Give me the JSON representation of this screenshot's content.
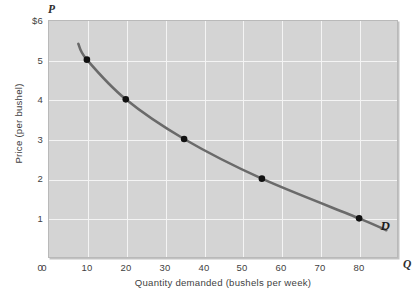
{
  "chart_data": {
    "type": "line",
    "title": "",
    "subtitle": "",
    "xlabel": "Quantity demanded (bushels per week)",
    "ylabel": "Price (per bushel)",
    "x_axis_symbol": "Q",
    "y_axis_symbol": "P",
    "xlim": [
      0,
      90
    ],
    "ylim": [
      0,
      6
    ],
    "grid": true,
    "legend": "none",
    "x_ticks": [
      "0",
      "10",
      "20",
      "30",
      "40",
      "50",
      "60",
      "70",
      "80"
    ],
    "x_tick_values": [
      0,
      10,
      20,
      30,
      40,
      50,
      60,
      70,
      80
    ],
    "y_ticks": [
      "0",
      "1",
      "2",
      "3",
      "4",
      "5",
      "$6"
    ],
    "y_tick_values": [
      0,
      1,
      2,
      3,
      4,
      5,
      6
    ],
    "series": [
      {
        "name": "D",
        "label": "D",
        "color": "#6a6a6a",
        "marker": "filled-circle",
        "marker_color": "#111111",
        "x": [
          10,
          20,
          35,
          55,
          80
        ],
        "values": [
          5,
          4,
          3,
          2,
          1
        ],
        "points": [
          {
            "q": 10,
            "p": 5
          },
          {
            "q": 20,
            "p": 4
          },
          {
            "q": 35,
            "p": 3
          },
          {
            "q": 55,
            "p": 2
          },
          {
            "q": 80,
            "p": 1
          }
        ]
      }
    ],
    "annotations": [
      {
        "text": "D",
        "q": 85,
        "p": 0.8,
        "style": "bold-italic"
      }
    ]
  },
  "figure": {
    "background_color": "#ffffff",
    "plot_background_color": "#d4d4d4",
    "gridline_color": "#f4f4f4",
    "curve_color": "#6a6a6a",
    "point_color": "#111111"
  }
}
